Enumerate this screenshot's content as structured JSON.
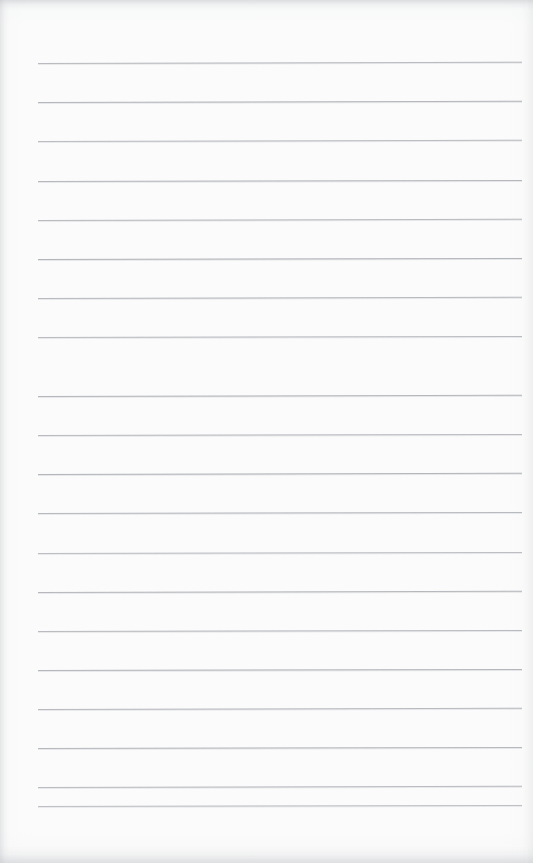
{
  "document": {
    "kind": "scanned-blank-ruled-page",
    "title": "Blank Ruled Notebook Page",
    "page_width": 533,
    "page_height": 863,
    "background_color": "#fdfdfd",
    "has_text": false,
    "has_handwriting": false,
    "has_margin_rule": false,
    "visible_text": ""
  },
  "ruling": {
    "line_color": "#a9acb1",
    "line_thickness_px": 1,
    "line_count": 20,
    "left_x": 38,
    "right_x": 522,
    "first_line_y": 63,
    "line_spacing_px": 39.1,
    "lines": [
      {
        "y": 63,
        "x1": 38,
        "x2": 522,
        "tilt_deg": -0.16,
        "opacity": 0.8
      },
      {
        "y": 102,
        "x1": 38,
        "x2": 522,
        "tilt_deg": -0.14,
        "opacity": 0.86
      },
      {
        "y": 141,
        "x1": 38,
        "x2": 522,
        "tilt_deg": -0.15,
        "opacity": 0.78
      },
      {
        "y": 181,
        "x1": 38,
        "x2": 522,
        "tilt_deg": -0.12,
        "opacity": 0.84
      },
      {
        "y": 220,
        "x1": 38,
        "x2": 522,
        "tilt_deg": -0.15,
        "opacity": 0.8
      },
      {
        "y": 259,
        "x1": 38,
        "x2": 522,
        "tilt_deg": -0.13,
        "opacity": 0.88
      },
      {
        "y": 298,
        "x1": 38,
        "x2": 522,
        "tilt_deg": -0.14,
        "opacity": 0.82
      },
      {
        "y": 337,
        "x1": 38,
        "x2": 522,
        "tilt_deg": -0.12,
        "opacity": 0.79
      },
      {
        "y": 357,
        "x1": 38,
        "x2": 522,
        "tilt_deg": -0.13,
        "opacity": 0.0
      },
      {
        "y": 396,
        "x1": 38,
        "x2": 522,
        "tilt_deg": -0.14,
        "opacity": 0.85
      },
      {
        "y": 435,
        "x1": 38,
        "x2": 522,
        "tilt_deg": -0.12,
        "opacity": 0.8
      },
      {
        "y": 474,
        "x1": 38,
        "x2": 522,
        "tilt_deg": -0.14,
        "opacity": 0.87
      },
      {
        "y": 513,
        "x1": 38,
        "x2": 522,
        "tilt_deg": -0.13,
        "opacity": 0.82
      },
      {
        "y": 553,
        "x1": 38,
        "x2": 522,
        "tilt_deg": -0.12,
        "opacity": 0.76
      },
      {
        "y": 592,
        "x1": 38,
        "x2": 522,
        "tilt_deg": -0.14,
        "opacity": 0.84
      },
      {
        "y": 631,
        "x1": 38,
        "x2": 522,
        "tilt_deg": -0.13,
        "opacity": 0.8
      },
      {
        "y": 670,
        "x1": 38,
        "x2": 522,
        "tilt_deg": -0.12,
        "opacity": 0.86
      },
      {
        "y": 709,
        "x1": 38,
        "x2": 522,
        "tilt_deg": -0.14,
        "opacity": 0.81
      },
      {
        "y": 723,
        "x1": 38,
        "x2": 522,
        "tilt_deg": -0.13,
        "opacity": 0.0
      },
      {
        "y": 748,
        "x1": 38,
        "x2": 522,
        "tilt_deg": -0.12,
        "opacity": 0.83
      },
      {
        "y": 787,
        "x1": 38,
        "x2": 522,
        "tilt_deg": -0.14,
        "opacity": 0.79
      },
      {
        "y": 806,
        "x1": 38,
        "x2": 522,
        "tilt_deg": -0.13,
        "opacity": 0.74
      }
    ]
  },
  "scan_artifacts": {
    "top_edge_shadow": true,
    "bottom_edge_shadow": true,
    "left_edge_shading": true,
    "right_edge_shading": true
  }
}
